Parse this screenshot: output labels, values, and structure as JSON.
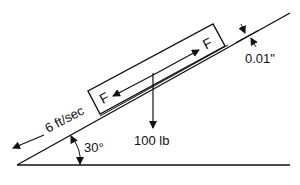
{
  "diagram": {
    "type": "inclined-plane-free-body",
    "labels": {
      "force_top": "F",
      "force_bottom": "F",
      "weight": "100 lb",
      "velocity": "6 ft/sec",
      "angle": "30°",
      "gap": "0.01\""
    },
    "colors": {
      "line": "#111111",
      "background": "#ffffff"
    }
  }
}
